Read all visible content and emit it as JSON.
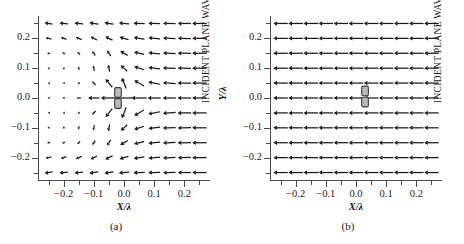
{
  "figure": {
    "panels": [
      {
        "id": "a",
        "caption": "(a)",
        "wave_label": "INCIDENT PLANE WAVE",
        "xaxis": {
          "title": "X/λ",
          "ticks": [
            "-0.2",
            "-0.1",
            "0.0",
            "0.1",
            "0.2"
          ],
          "tick_values": [
            -0.2,
            -0.1,
            0.0,
            0.1,
            0.2
          ],
          "range": [
            -0.285,
            0.285
          ],
          "minor_step": 0.05
        },
        "yaxis": {
          "title": "Y/λ",
          "ticks": [
            "0.2",
            "0.1",
            "0.0",
            "-0.1",
            "-0.2"
          ],
          "tick_values": [
            0.2,
            0.1,
            0.0,
            -0.1,
            -0.2
          ],
          "range": [
            -0.275,
            0.275
          ],
          "minor_step": 0.05
        }
      },
      {
        "id": "b",
        "caption": "(b)",
        "wave_label": "INCIDENT PLANE WAVE",
        "xaxis": {
          "title": "X/λ",
          "ticks": [
            "-0.2",
            "-0.1",
            "0.0",
            "0.1",
            "0.2"
          ],
          "tick_values": [
            -0.2,
            -0.1,
            0.0,
            0.1,
            0.2
          ],
          "range": [
            -0.285,
            0.285
          ],
          "minor_step": 0.05
        },
        "yaxis": {
          "title": "Y/λ",
          "ticks": [
            "0.2",
            "0.1",
            "0.0",
            "-0.1",
            "-0.2"
          ],
          "tick_values": [
            0.2,
            0.1,
            0.0,
            -0.1,
            -0.2
          ],
          "range": [
            -0.275,
            0.275
          ],
          "minor_step": 0.05
        }
      }
    ]
  },
  "chart_data": [
    {
      "type": "quiver",
      "panel": "a",
      "title": "",
      "xlabel": "X/λ",
      "ylabel": "Y/λ",
      "xlim": [
        -0.285,
        0.285
      ],
      "ylim": [
        -0.275,
        0.275
      ],
      "grid": false,
      "legend": null,
      "annotations": [
        "INCIDENT PLANE WAVE",
        "(a)"
      ],
      "description": "Near-field vector plot showing strong dipole-like scattering: field vectors converge radially onto a small scatterer at the origin; a shadow region of very short vectors lies to the left, while vectors at the right edge remain full-length and point in the -x direction.",
      "arrow_color": "#1a1a1a",
      "grid_x": [
        -0.25,
        -0.2,
        -0.15,
        -0.1,
        -0.05,
        0.0,
        0.05,
        0.1,
        0.15,
        0.2,
        0.25
      ],
      "grid_y": [
        0.25,
        0.2,
        0.15,
        0.1,
        0.05,
        0.0,
        -0.05,
        -0.1,
        -0.15,
        -0.2,
        -0.25
      ],
      "scatterer": {
        "x": -0.02,
        "y": 0.0,
        "width": 0.022,
        "height": 0.075,
        "segments": 2,
        "fill": "#b9b9b9",
        "edge": "#3a3a3a"
      },
      "vectors": [
        {
          "x": -0.25,
          "y": 0.25,
          "u": -0.55,
          "v": 0.08
        },
        {
          "x": -0.2,
          "y": 0.25,
          "u": -0.58,
          "v": 0.06
        },
        {
          "x": -0.15,
          "y": 0.25,
          "u": -0.6,
          "v": 0.06
        },
        {
          "x": -0.1,
          "y": 0.25,
          "u": -0.62,
          "v": 0.08
        },
        {
          "x": -0.05,
          "y": 0.25,
          "u": -0.62,
          "v": 0.1
        },
        {
          "x": 0.0,
          "y": 0.25,
          "u": -0.7,
          "v": 0.06
        },
        {
          "x": 0.05,
          "y": 0.25,
          "u": -0.78,
          "v": 0.04
        },
        {
          "x": 0.1,
          "y": 0.25,
          "u": -0.82,
          "v": 0.02
        },
        {
          "x": 0.15,
          "y": 0.25,
          "u": -0.86,
          "v": 0.02
        },
        {
          "x": 0.2,
          "y": 0.25,
          "u": -0.9,
          "v": 0.0
        },
        {
          "x": 0.25,
          "y": 0.25,
          "u": -1.0,
          "v": 0.0
        },
        {
          "x": -0.25,
          "y": 0.2,
          "u": -0.4,
          "v": 0.1
        },
        {
          "x": -0.2,
          "y": 0.2,
          "u": -0.38,
          "v": 0.14
        },
        {
          "x": -0.15,
          "y": 0.2,
          "u": -0.4,
          "v": 0.18
        },
        {
          "x": -0.1,
          "y": 0.2,
          "u": -0.44,
          "v": 0.22
        },
        {
          "x": -0.05,
          "y": 0.2,
          "u": -0.5,
          "v": 0.24
        },
        {
          "x": 0.0,
          "y": 0.2,
          "u": -0.62,
          "v": 0.18
        },
        {
          "x": 0.05,
          "y": 0.2,
          "u": -0.74,
          "v": 0.12
        },
        {
          "x": 0.1,
          "y": 0.2,
          "u": -0.8,
          "v": 0.08
        },
        {
          "x": 0.15,
          "y": 0.2,
          "u": -0.86,
          "v": 0.04
        },
        {
          "x": 0.2,
          "y": 0.2,
          "u": -0.9,
          "v": 0.02
        },
        {
          "x": 0.25,
          "y": 0.2,
          "u": -1.0,
          "v": 0.0
        },
        {
          "x": -0.25,
          "y": 0.15,
          "u": -0.22,
          "v": 0.05
        },
        {
          "x": -0.2,
          "y": 0.15,
          "u": -0.2,
          "v": 0.1
        },
        {
          "x": -0.15,
          "y": 0.15,
          "u": -0.18,
          "v": 0.2
        },
        {
          "x": -0.1,
          "y": 0.15,
          "u": -0.2,
          "v": 0.3
        },
        {
          "x": -0.05,
          "y": 0.15,
          "u": -0.26,
          "v": 0.38
        },
        {
          "x": 0.0,
          "y": 0.15,
          "u": -0.52,
          "v": 0.3
        },
        {
          "x": 0.05,
          "y": 0.15,
          "u": -0.7,
          "v": 0.16
        },
        {
          "x": 0.1,
          "y": 0.15,
          "u": -0.8,
          "v": 0.08
        },
        {
          "x": 0.15,
          "y": 0.15,
          "u": -0.86,
          "v": 0.04
        },
        {
          "x": 0.2,
          "y": 0.15,
          "u": -0.92,
          "v": 0.02
        },
        {
          "x": 0.25,
          "y": 0.15,
          "u": -1.0,
          "v": 0.0
        },
        {
          "x": -0.25,
          "y": 0.1,
          "u": -0.14,
          "v": 0.04
        },
        {
          "x": -0.2,
          "y": 0.1,
          "u": -0.12,
          "v": 0.1
        },
        {
          "x": -0.15,
          "y": 0.1,
          "u": -0.08,
          "v": 0.22
        },
        {
          "x": -0.1,
          "y": 0.1,
          "u": -0.06,
          "v": 0.36
        },
        {
          "x": -0.05,
          "y": 0.1,
          "u": -0.1,
          "v": 0.48
        },
        {
          "x": 0.0,
          "y": 0.1,
          "u": -0.44,
          "v": 0.42
        },
        {
          "x": 0.05,
          "y": 0.1,
          "u": -0.68,
          "v": 0.22
        },
        {
          "x": 0.1,
          "y": 0.1,
          "u": -0.8,
          "v": 0.1
        },
        {
          "x": 0.15,
          "y": 0.1,
          "u": -0.88,
          "v": 0.04
        },
        {
          "x": 0.2,
          "y": 0.1,
          "u": -0.92,
          "v": 0.02
        },
        {
          "x": 0.25,
          "y": 0.1,
          "u": -1.0,
          "v": 0.0
        },
        {
          "x": -0.25,
          "y": 0.05,
          "u": -0.12,
          "v": 0.02
        },
        {
          "x": -0.2,
          "y": 0.05,
          "u": -0.12,
          "v": 0.04
        },
        {
          "x": -0.15,
          "y": 0.05,
          "u": -0.14,
          "v": 0.1
        },
        {
          "x": -0.1,
          "y": 0.05,
          "u": -0.24,
          "v": 0.26
        },
        {
          "x": -0.05,
          "y": 0.05,
          "u": -0.46,
          "v": 0.58
        },
        {
          "x": 0.0,
          "y": 0.05,
          "u": -0.3,
          "v": 0.74
        },
        {
          "x": 0.05,
          "y": 0.05,
          "u": -0.66,
          "v": 0.4
        },
        {
          "x": 0.1,
          "y": 0.05,
          "u": -0.82,
          "v": 0.16
        },
        {
          "x": 0.15,
          "y": 0.05,
          "u": -0.88,
          "v": 0.06
        },
        {
          "x": 0.2,
          "y": 0.05,
          "u": -0.94,
          "v": 0.02
        },
        {
          "x": 0.25,
          "y": 0.05,
          "u": -1.0,
          "v": 0.0
        },
        {
          "x": -0.25,
          "y": 0.0,
          "u": -0.14,
          "v": 0.0
        },
        {
          "x": -0.2,
          "y": 0.0,
          "u": -0.16,
          "v": 0.0
        },
        {
          "x": -0.15,
          "y": 0.0,
          "u": -0.3,
          "v": 0.0
        },
        {
          "x": -0.1,
          "y": 0.0,
          "u": -0.78,
          "v": 0.0
        },
        {
          "x": -0.05,
          "y": 0.0,
          "u": -1.1,
          "v": 0.0
        },
        {
          "x": 0.0,
          "y": 0.0,
          "u": -1.1,
          "v": 0.0
        },
        {
          "x": 0.05,
          "y": 0.0,
          "u": -1.05,
          "v": 0.0
        },
        {
          "x": 0.1,
          "y": 0.0,
          "u": -0.9,
          "v": 0.0
        },
        {
          "x": 0.15,
          "y": 0.0,
          "u": -0.9,
          "v": 0.0
        },
        {
          "x": 0.2,
          "y": 0.0,
          "u": -0.94,
          "v": 0.0
        },
        {
          "x": 0.25,
          "y": 0.0,
          "u": -1.0,
          "v": 0.0
        },
        {
          "x": -0.25,
          "y": -0.05,
          "u": -0.12,
          "v": -0.02
        },
        {
          "x": -0.2,
          "y": -0.05,
          "u": -0.12,
          "v": -0.04
        },
        {
          "x": -0.15,
          "y": -0.05,
          "u": -0.14,
          "v": -0.1
        },
        {
          "x": -0.1,
          "y": -0.05,
          "u": -0.24,
          "v": -0.26
        },
        {
          "x": -0.05,
          "y": -0.05,
          "u": -0.46,
          "v": -0.58
        },
        {
          "x": 0.0,
          "y": -0.05,
          "u": -0.3,
          "v": -0.74
        },
        {
          "x": 0.05,
          "y": -0.05,
          "u": -0.66,
          "v": -0.4
        },
        {
          "x": 0.1,
          "y": -0.05,
          "u": -0.82,
          "v": -0.16
        },
        {
          "x": 0.15,
          "y": -0.05,
          "u": -0.88,
          "v": -0.06
        },
        {
          "x": 0.2,
          "y": -0.05,
          "u": -0.94,
          "v": -0.02
        },
        {
          "x": 0.25,
          "y": -0.05,
          "u": -1.0,
          "v": 0.0
        },
        {
          "x": -0.25,
          "y": -0.1,
          "u": -0.14,
          "v": -0.04
        },
        {
          "x": -0.2,
          "y": -0.1,
          "u": -0.12,
          "v": -0.1
        },
        {
          "x": -0.15,
          "y": -0.1,
          "u": -0.08,
          "v": -0.22
        },
        {
          "x": -0.1,
          "y": -0.1,
          "u": -0.06,
          "v": -0.36
        },
        {
          "x": -0.05,
          "y": -0.1,
          "u": -0.1,
          "v": -0.48
        },
        {
          "x": 0.0,
          "y": -0.1,
          "u": -0.44,
          "v": -0.42
        },
        {
          "x": 0.05,
          "y": -0.1,
          "u": -0.68,
          "v": -0.22
        },
        {
          "x": 0.1,
          "y": -0.1,
          "u": -0.8,
          "v": -0.1
        },
        {
          "x": 0.15,
          "y": -0.1,
          "u": -0.88,
          "v": -0.04
        },
        {
          "x": 0.2,
          "y": -0.1,
          "u": -0.92,
          "v": -0.02
        },
        {
          "x": 0.25,
          "y": -0.1,
          "u": -1.0,
          "v": 0.0
        },
        {
          "x": -0.25,
          "y": -0.15,
          "u": -0.22,
          "v": -0.05
        },
        {
          "x": -0.2,
          "y": -0.15,
          "u": -0.2,
          "v": -0.1
        },
        {
          "x": -0.15,
          "y": -0.15,
          "u": -0.18,
          "v": -0.2
        },
        {
          "x": -0.1,
          "y": -0.15,
          "u": -0.2,
          "v": -0.3
        },
        {
          "x": -0.05,
          "y": -0.15,
          "u": -0.26,
          "v": -0.38
        },
        {
          "x": 0.0,
          "y": -0.15,
          "u": -0.52,
          "v": -0.3
        },
        {
          "x": 0.05,
          "y": -0.15,
          "u": -0.7,
          "v": -0.16
        },
        {
          "x": 0.1,
          "y": -0.15,
          "u": -0.8,
          "v": -0.08
        },
        {
          "x": 0.15,
          "y": -0.15,
          "u": -0.86,
          "v": -0.04
        },
        {
          "x": 0.2,
          "y": -0.15,
          "u": -0.92,
          "v": -0.02
        },
        {
          "x": 0.25,
          "y": -0.15,
          "u": -1.0,
          "v": 0.0
        },
        {
          "x": -0.25,
          "y": -0.2,
          "u": -0.4,
          "v": -0.1
        },
        {
          "x": -0.2,
          "y": -0.2,
          "u": -0.38,
          "v": -0.14
        },
        {
          "x": -0.15,
          "y": -0.2,
          "u": -0.4,
          "v": -0.18
        },
        {
          "x": -0.1,
          "y": -0.2,
          "u": -0.44,
          "v": -0.22
        },
        {
          "x": -0.05,
          "y": -0.2,
          "u": -0.5,
          "v": -0.24
        },
        {
          "x": 0.0,
          "y": -0.2,
          "u": -0.62,
          "v": -0.18
        },
        {
          "x": 0.05,
          "y": -0.2,
          "u": -0.74,
          "v": -0.12
        },
        {
          "x": 0.1,
          "y": -0.2,
          "u": -0.8,
          "v": -0.08
        },
        {
          "x": 0.15,
          "y": -0.2,
          "u": -0.86,
          "v": -0.04
        },
        {
          "x": 0.2,
          "y": -0.2,
          "u": -0.9,
          "v": -0.02
        },
        {
          "x": 0.25,
          "y": -0.2,
          "u": -1.0,
          "v": 0.0
        },
        {
          "x": -0.25,
          "y": -0.25,
          "u": -0.55,
          "v": -0.08
        },
        {
          "x": -0.2,
          "y": -0.25,
          "u": -0.58,
          "v": -0.06
        },
        {
          "x": -0.15,
          "y": -0.25,
          "u": -0.6,
          "v": -0.06
        },
        {
          "x": -0.1,
          "y": -0.25,
          "u": -0.62,
          "v": -0.08
        },
        {
          "x": -0.05,
          "y": -0.25,
          "u": -0.62,
          "v": -0.1
        },
        {
          "x": 0.0,
          "y": -0.25,
          "u": -0.7,
          "v": -0.06
        },
        {
          "x": 0.05,
          "y": -0.25,
          "u": -0.78,
          "v": -0.04
        },
        {
          "x": 0.1,
          "y": -0.25,
          "u": -0.82,
          "v": -0.02
        },
        {
          "x": 0.15,
          "y": -0.25,
          "u": -0.86,
          "v": -0.02
        },
        {
          "x": 0.2,
          "y": -0.25,
          "u": -0.9,
          "v": 0.0
        },
        {
          "x": 0.25,
          "y": -0.25,
          "u": -1.0,
          "v": 0.0
        }
      ]
    },
    {
      "type": "quiver",
      "panel": "b",
      "title": "",
      "xlabel": "X/λ",
      "ylabel": "Y/λ",
      "xlim": [
        -0.285,
        0.285
      ],
      "ylim": [
        -0.275,
        0.275
      ],
      "grid": false,
      "legend": null,
      "annotations": [
        "INCIDENT PLANE WAVE",
        "(b)"
      ],
      "description": "Uniform incident plane wave: every vector has equal magnitude and points in the -x direction; the small scatterer near the origin produces no visible perturbation of the field.",
      "arrow_color": "#1a1a1a",
      "grid_x": [
        -0.25,
        -0.2,
        -0.15,
        -0.1,
        -0.05,
        0.0,
        0.05,
        0.1,
        0.15,
        0.2,
        0.25
      ],
      "grid_y": [
        0.25,
        0.2,
        0.15,
        0.1,
        0.05,
        0.0,
        -0.05,
        -0.1,
        -0.15,
        -0.2,
        -0.25
      ],
      "scatterer": {
        "x": 0.03,
        "y": 0.005,
        "width": 0.022,
        "height": 0.075,
        "segments": 2,
        "fill": "#b9b9b9",
        "edge": "#3a3a3a"
      },
      "uniform_vector": {
        "u": -1.0,
        "v": 0.0
      }
    }
  ]
}
